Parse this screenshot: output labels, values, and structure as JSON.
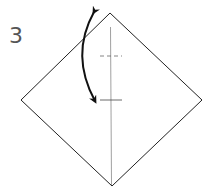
{
  "diagram": {
    "type": "origami-step",
    "step_number": "3",
    "shape": "square-diamond",
    "colors": {
      "outline": "#222222",
      "crease": "#888888",
      "arrow": "#111111",
      "step_number": "#555555"
    },
    "elements": [
      "diamond-outline",
      "vertical-center-crease",
      "dashed-valley-mark",
      "solid-crease-mark",
      "fold-and-unfold-arrow"
    ]
  }
}
